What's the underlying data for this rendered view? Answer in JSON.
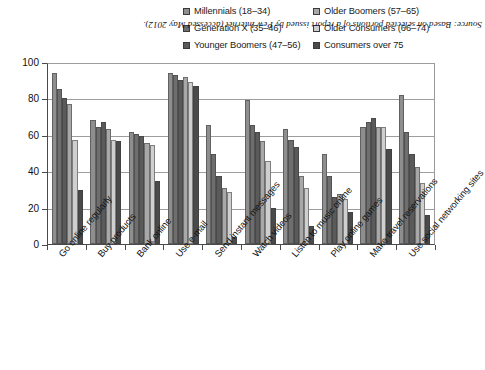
{
  "chart_data": {
    "type": "bar",
    "title": "",
    "subtitle": "",
    "xlabel": "",
    "ylabel": "",
    "ylim": [
      0,
      100
    ],
    "yticks": [
      0,
      20,
      40,
      60,
      80,
      100
    ],
    "grid": true,
    "legend_position": "top",
    "orientation": "vertical-grouped",
    "categories": [
      "Go online regularly",
      "Buy products",
      "Bank online",
      "Use e-mail",
      "Send instant messages",
      "Watch videos",
      "Listen to music online",
      "Play online games",
      "Make travel reservations",
      "Use social networking sites"
    ],
    "series": [
      {
        "name": "Millennials (18–34)",
        "color": "#8e8e8e",
        "values": [
          95,
          69,
          62,
          95,
          66,
          80,
          64,
          50,
          65,
          83
        ]
      },
      {
        "name": "Generation X (35–46)",
        "color": "#6e6e6e",
        "values": [
          86,
          65,
          61,
          94,
          50,
          66,
          58,
          38,
          68,
          62
        ]
      },
      {
        "name": "Younger Boomers (47–56)",
        "color": "#5a5a5a",
        "values": [
          81,
          68,
          60,
          91,
          38,
          62,
          54,
          26,
          70,
          50
        ]
      },
      {
        "name": "Older Boomers (57–65)",
        "color": "#a8a8a8",
        "values": [
          78,
          64,
          56,
          93,
          31,
          57,
          38,
          28,
          65,
          43
        ]
      },
      {
        "name": "Older Consumers (66–74)",
        "color": "#cfcfcf",
        "values": [
          58,
          58,
          55,
          90,
          29,
          46,
          31,
          25,
          65,
          34
        ]
      },
      {
        "name": "Consumers over 75",
        "color": "#4a4a4a",
        "values": [
          30,
          57,
          35,
          88,
          4,
          20,
          10,
          18,
          53,
          16
        ]
      }
    ],
    "source_note": "Source: Based on selected portions of a report issued by Pew Internet (accessed May 2012)."
  },
  "legend": {
    "items": [
      {
        "label": "Millennials (18–34)",
        "color": "#8e8e8e"
      },
      {
        "label": "Older Boomers (57–65)",
        "color": "#a8a8a8"
      },
      {
        "label": "Generation X (35–46)",
        "color": "#6e6e6e"
      },
      {
        "label": "Older Consumers (66–74)",
        "color": "#cfcfcf"
      },
      {
        "label": "Younger Boomers (47–56)",
        "color": "#5a5a5a"
      },
      {
        "label": "Consumers over 75",
        "color": "#4a4a4a"
      }
    ]
  }
}
